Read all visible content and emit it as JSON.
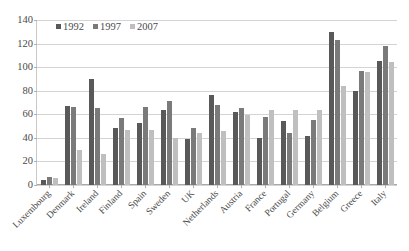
{
  "chart_data": {
    "type": "bar",
    "title": "",
    "xlabel": "",
    "ylabel": "",
    "ylim": [
      0,
      140
    ],
    "yticks": [
      0,
      20,
      40,
      60,
      80,
      100,
      120,
      140
    ],
    "grid": true,
    "legend_position": "top-left-inside",
    "categories": [
      "Luxembourg",
      "Denmark",
      "Ireland",
      "Finland",
      "Spain",
      "Sweden",
      "UK",
      "Netherlands",
      "Austria",
      "France",
      "Portugal",
      "Germany",
      "Belgium",
      "Greece",
      "Italy"
    ],
    "series": [
      {
        "name": "1992",
        "color": "#595959",
        "values": [
          4,
          67,
          90,
          48,
          53,
          64,
          39,
          76,
          62,
          40,
          54,
          42,
          130,
          80,
          105
        ]
      },
      {
        "name": "1997",
        "color": "#7a7a7a",
        "values": [
          7,
          66,
          65,
          57,
          66,
          71,
          48,
          68,
          65,
          58,
          44,
          55,
          123,
          97,
          118
        ]
      },
      {
        "name": "2007",
        "color": "#bfbfbf",
        "values": [
          6,
          30,
          26,
          47,
          47,
          40,
          44,
          46,
          59,
          64,
          64,
          64,
          84,
          96,
          104
        ]
      }
    ]
  },
  "colors": {
    "gridline": "#d4d4d4",
    "axis": "#a8a8a8",
    "text": "#4a4a4a",
    "background": "#ffffff"
  }
}
